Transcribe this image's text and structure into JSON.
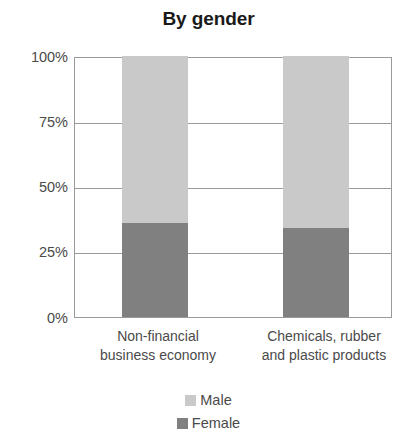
{
  "chart_data": {
    "type": "bar",
    "title": "By gender",
    "subtitle": "",
    "xlabel": "",
    "ylabel": "",
    "stacked": true,
    "stacked_percent": true,
    "grid": true,
    "legend_position": "bottom",
    "ylim": [
      0,
      100
    ],
    "yticks": [
      "0%",
      "25%",
      "50%",
      "75%",
      "100%"
    ],
    "ytick_values": [
      0,
      25,
      50,
      75,
      100
    ],
    "categories": [
      "Non-financial business economy",
      "Chemicals, rubber and plastic products"
    ],
    "category_lines": [
      [
        "Non-financial",
        "business economy"
      ],
      [
        "Chemicals, rubber",
        "and plastic products"
      ]
    ],
    "series": [
      {
        "name": "Male",
        "color": "#c9c9c9",
        "values": [
          64,
          66
        ]
      },
      {
        "name": "Female",
        "color": "#808080",
        "values": [
          36,
          34
        ]
      }
    ]
  },
  "colors": {
    "male": "#c9c9c9",
    "female": "#808080",
    "axis": "#9a9a9a",
    "text": "#4a4a4a",
    "title": "#1a1a1a",
    "background": "#ffffff"
  },
  "axis": {
    "tick_100": "100%",
    "tick_75": "75%",
    "tick_50": "50%",
    "tick_25": "25%",
    "tick_0": "0%"
  },
  "categories_text": {
    "cat0_line1": "Non-financial",
    "cat0_line2": "business economy",
    "cat1_line1": "Chemicals, rubber",
    "cat1_line2": "and plastic products"
  },
  "legend": {
    "items": [
      {
        "label": "Male"
      },
      {
        "label": "Female"
      }
    ]
  }
}
